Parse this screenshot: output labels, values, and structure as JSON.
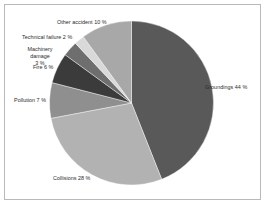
{
  "chart_data": {
    "type": "pie",
    "title": "",
    "subtitle": "",
    "xlabel": "",
    "ylabel": "",
    "legend_position": "none",
    "grid": false,
    "start_angle_deg": 0,
    "direction": "clockwise",
    "units": "%",
    "categories": [
      "Groundings",
      "Collisions",
      "Pollution",
      "Fire",
      "Machinery damage",
      "Technical failure",
      "Other accident"
    ],
    "values": [
      44,
      28,
      7,
      6,
      3,
      2,
      10
    ],
    "total": 100,
    "labels": [
      "Groundings 44 %",
      "Collisions 28 %",
      "Pollution 7 %",
      "Fire 6 %",
      "Machinery damage 3 %",
      "Technical failure 2 %",
      "Other accident 10 %"
    ],
    "colors": [
      "#595959",
      "#b2b2b2",
      "#8f8f8f",
      "#3b3b3b",
      "#6e6e6e",
      "#d9d9d9",
      "#a8a8a8"
    ],
    "slices": [
      {
        "name": "Groundings",
        "value": 44,
        "label": "Groundings 44 %",
        "color": "#595959"
      },
      {
        "name": "Collisions",
        "value": 28,
        "label": "Collisions 28 %",
        "color": "#b2b2b2"
      },
      {
        "name": "Pollution",
        "value": 7,
        "label": "Pollution 7 %",
        "color": "#8f8f8f"
      },
      {
        "name": "Fire",
        "value": 6,
        "label": "Fire 6 %",
        "color": "#3b3b3b"
      },
      {
        "name": "Machinery damage",
        "value": 3,
        "label": "Machinery damage 3 %",
        "color": "#6e6e6e"
      },
      {
        "name": "Technical failure",
        "value": 2,
        "label": "Technical failure 2 %",
        "color": "#d9d9d9"
      },
      {
        "name": "Other accident",
        "value": 10,
        "label": "Other accident 10 %",
        "color": "#a8a8a8"
      }
    ]
  },
  "labels_text": {
    "groundings": "Groundings 44 %",
    "collisions": "Collisions 28 %",
    "pollution": "Pollution 7 %",
    "fire": "Fire 6 %",
    "machinery_line1": "Machinery damage",
    "machinery_line2": "3 %",
    "technical": "Technical failure 2 %",
    "other": "Other accident 10 %"
  },
  "style": {
    "background": "#ffffff",
    "border_color": "#b9b9b9",
    "text_color": "#2b2b2b"
  }
}
